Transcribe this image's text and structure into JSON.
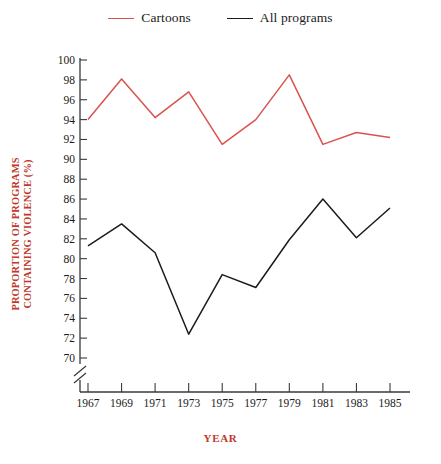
{
  "legend": {
    "position": "top-center",
    "entries": [
      {
        "label": "Cartoons",
        "color": "#d9534f",
        "name": "legend-cartoons"
      },
      {
        "label": "All programs",
        "color": "#1b1b1b",
        "name": "legend-all-programs"
      }
    ]
  },
  "axes": {
    "ylabel_line1": "PROPORTION OF PROGRAMS",
    "ylabel_line2": "CONTAINING VIOLENCE (%)",
    "xlabel": "YEAR",
    "label_color": "#c0392b",
    "y_axis_break": true
  },
  "chart_data": {
    "type": "line",
    "title": "",
    "xlabel": "YEAR",
    "ylabel": "PROPORTION OF PROGRAMS CONTAINING VIOLENCE (%)",
    "x": [
      1967,
      1969,
      1971,
      1973,
      1975,
      1977,
      1979,
      1981,
      1983,
      1985
    ],
    "xtick_labels": [
      "1967",
      "1969",
      "1971",
      "1973",
      "1975",
      "1977",
      "1979",
      "1981",
      "1983",
      "1985"
    ],
    "ytick_labels": [
      "70",
      "72",
      "74",
      "76",
      "78",
      "80",
      "82",
      "84",
      "86",
      "88",
      "90",
      "92",
      "94",
      "96",
      "98",
      "100"
    ],
    "ytick_values": [
      70,
      72,
      74,
      76,
      78,
      80,
      82,
      84,
      86,
      88,
      90,
      92,
      94,
      96,
      98,
      100
    ],
    "ylim": [
      69,
      100.6
    ],
    "xlim": [
      1966,
      1986
    ],
    "grid": false,
    "legend_position": "top-center",
    "series": [
      {
        "name": "Cartoons",
        "color": "#d9534f",
        "values": [
          94.0,
          98.1,
          94.2,
          96.8,
          91.5,
          94.0,
          98.5,
          91.5,
          92.7,
          92.2
        ]
      },
      {
        "name": "All programs",
        "color": "#1b1b1b",
        "values": [
          81.3,
          83.5,
          80.6,
          72.4,
          78.4,
          77.1,
          81.9,
          86.0,
          82.1,
          85.1
        ]
      }
    ]
  }
}
